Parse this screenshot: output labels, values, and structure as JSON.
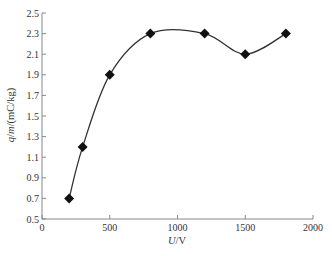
{
  "chart_data": {
    "type": "line",
    "title": "",
    "xlabel": "U/V",
    "xlabel_parts": [
      {
        "text": "U",
        "italic": true
      },
      {
        "text": "/V",
        "italic": false
      }
    ],
    "ylabel": "q/m/(mC/kg)",
    "ylabel_parts": [
      {
        "text": "q",
        "italic": true
      },
      {
        "text": "/",
        "italic": false
      },
      {
        "text": "m",
        "italic": true
      },
      {
        "text": "/(mC/kg)",
        "italic": false
      }
    ],
    "xlim": [
      0,
      2000
    ],
    "ylim": [
      0.5,
      2.5
    ],
    "xticks": [
      0,
      500,
      1000,
      1500,
      2000
    ],
    "yticks": [
      0.5,
      0.7,
      0.9,
      1.1,
      1.3,
      1.5,
      1.7,
      1.9,
      2.1,
      2.3,
      2.5
    ],
    "ytick_labels": [
      "0.5",
      "0.7",
      "0.9",
      "1.1",
      "1.3",
      "1.5",
      "1.7",
      "1.9",
      "2.1",
      "2.3",
      "2.5"
    ],
    "grid": false,
    "legend": null,
    "series": [
      {
        "name": "q/m",
        "marker": "diamond",
        "smooth": true,
        "color": "#1a1a1a",
        "x": [
          200,
          300,
          500,
          800,
          1200,
          1500,
          1800
        ],
        "y": [
          0.7,
          1.2,
          1.9,
          2.3,
          2.3,
          2.1,
          2.3
        ]
      }
    ]
  },
  "colors": {
    "axis": "#888888",
    "line": "#333333",
    "marker": "#111111",
    "text": "#333333"
  }
}
